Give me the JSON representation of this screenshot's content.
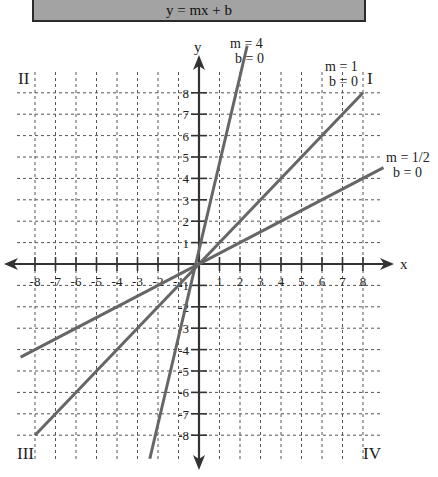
{
  "header": {
    "title": "y = mx + b"
  },
  "axes": {
    "x_label": "x",
    "y_label": "y"
  },
  "quadrants": {
    "I": "I",
    "II": "II",
    "III": "III",
    "IV": "IV"
  },
  "annotations": {
    "m4": {
      "m": "m = 4",
      "b": "b = 0"
    },
    "m1": {
      "m": "m = 1",
      "b": "b = 0"
    },
    "mhalf": {
      "m": "m = 1/2",
      "b": "b = 0"
    }
  },
  "colors": {
    "line": "#666666",
    "axis": "#333333",
    "grid": "#555555",
    "title_bg": "#a3a3a3"
  },
  "chart_data": {
    "type": "line",
    "title": "y = mx + b",
    "xlabel": "x",
    "ylabel": "y",
    "xlim": [
      -9,
      9
    ],
    "ylim": [
      -9,
      9
    ],
    "x_ticks": [
      -8,
      -7,
      -6,
      -5,
      -4,
      -3,
      -2,
      -1,
      1,
      2,
      3,
      4,
      5,
      6,
      7,
      8
    ],
    "y_ticks": [
      -8,
      -7,
      -6,
      -5,
      -4,
      -3,
      -2,
      -1,
      1,
      2,
      3,
      4,
      5,
      6,
      7,
      8
    ],
    "grid": true,
    "series": [
      {
        "name": "m = 4, b = 0",
        "m": 4,
        "b": 0,
        "x": [
          -2.4,
          2.35
        ],
        "y": [
          -9.1,
          10.2
        ]
      },
      {
        "name": "m = 1, b = 0",
        "m": 1,
        "b": 0,
        "x": [
          -8,
          8
        ],
        "y": [
          -8,
          8
        ]
      },
      {
        "name": "m = 1/2, b = 0",
        "m": 0.5,
        "b": 0,
        "x": [
          -8.7,
          9
        ],
        "y": [
          -4.35,
          4.5
        ]
      }
    ],
    "quadrant_labels": [
      "I",
      "II",
      "III",
      "IV"
    ]
  }
}
